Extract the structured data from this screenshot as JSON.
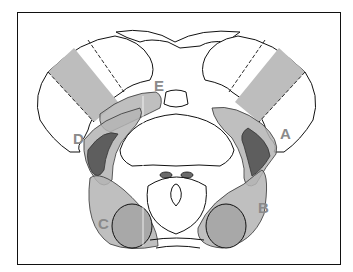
{
  "diagram": {
    "type": "anatomical cross-section",
    "labels": [
      {
        "id": "A",
        "text": "A"
      },
      {
        "id": "B",
        "text": "B"
      },
      {
        "id": "C",
        "text": "C"
      },
      {
        "id": "D",
        "text": "D"
      },
      {
        "id": "E",
        "text": "E"
      }
    ],
    "colors": {
      "outline": "#111111",
      "light_fill": "#b4b4b4",
      "mid_fill": "#8c8c8c",
      "dark_fill": "#5e5e5e",
      "band_fill": "#bdbdbd",
      "label_color": "#8a8a8a",
      "background": "#ffffff"
    }
  }
}
